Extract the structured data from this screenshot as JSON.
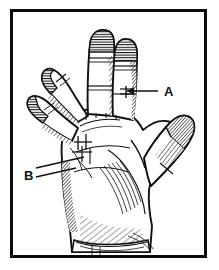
{
  "figure": {
    "style": "pen-and-ink cross-hatch medical illustration",
    "background_color": "#ffffff",
    "ink_color": "#111111",
    "frame": {
      "visible": true,
      "color": "#0a0a0a",
      "thickness_px": 3,
      "x": 10,
      "y": 9,
      "width": 197,
      "height": 249
    },
    "annotations": [
      {
        "id": "label-a",
        "label": "A",
        "label_x": 164,
        "label_y": 95,
        "leader_count": 1,
        "points_to": "ring-finger-proximal-phalanx",
        "marker": "cross-hatch-suture"
      },
      {
        "id": "label-b",
        "label": "B",
        "label_x": 24,
        "label_y": 176,
        "leader_count": 2,
        "points_to": "palm-ulnar-incision-site",
        "marker": "cross-hatch-suture"
      }
    ],
    "parts": [
      {
        "name": "middle-finger",
        "state": "extended"
      },
      {
        "name": "ring-finger",
        "state": "extended"
      },
      {
        "name": "index-finger",
        "state": "flexed"
      },
      {
        "name": "little-finger",
        "state": "flexed"
      },
      {
        "name": "thumb",
        "state": "abducted"
      },
      {
        "name": "palm",
        "state": "shaded"
      },
      {
        "name": "wrist",
        "state": "shaded"
      }
    ]
  }
}
